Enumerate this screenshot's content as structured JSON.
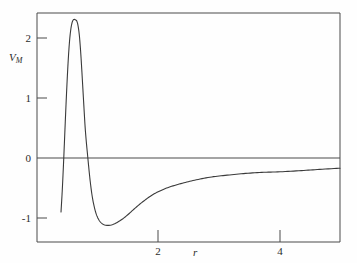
{
  "figure": {
    "background_color": "#fefefe",
    "line_color": "#3a3a3a",
    "axis_color": "#4a4a4a"
  },
  "chart_data": {
    "type": "line",
    "title": "",
    "subtitle": "",
    "xlabel": "r",
    "ylabel": "V_M",
    "ylabel_base": "V",
    "ylabel_sub": "M",
    "grid": false,
    "legend": "none",
    "xlim": [
      0.02,
      4.99
    ],
    "ylim": [
      -1.4,
      2.44
    ],
    "xticks": [
      2,
      4
    ],
    "xtick_labels": [
      "2",
      "4"
    ],
    "yticks": [
      2,
      1,
      0,
      -1
    ],
    "ytick_labels": [
      "2",
      "1",
      "0",
      "-1"
    ],
    "zero_line": 0,
    "annotations": [],
    "series": [
      {
        "name": "V_M",
        "x": [
          0.41,
          0.43,
          0.45,
          0.47,
          0.49,
          0.51,
          0.53,
          0.55,
          0.57,
          0.59,
          0.61,
          0.63,
          0.65,
          0.67,
          0.69,
          0.71,
          0.73,
          0.75,
          0.78,
          0.81,
          0.85,
          0.89,
          0.93,
          0.98,
          1.03,
          1.08,
          1.14,
          1.22,
          1.3,
          1.4,
          1.5,
          1.62,
          1.75,
          1.9,
          2.05,
          2.2,
          2.4,
          2.6,
          2.85,
          3.1,
          3.4,
          3.7,
          4.0,
          4.35,
          4.65,
          4.99
        ],
        "y": [
          -0.9,
          -0.55,
          -0.12,
          0.36,
          0.84,
          1.28,
          1.66,
          1.95,
          2.14,
          2.25,
          2.3,
          2.31,
          2.3,
          2.28,
          2.2,
          2.05,
          1.8,
          1.48,
          0.95,
          0.45,
          0.0,
          -0.4,
          -0.69,
          -0.91,
          -1.03,
          -1.09,
          -1.12,
          -1.12,
          -1.09,
          -1.03,
          -0.95,
          -0.84,
          -0.73,
          -0.62,
          -0.54,
          -0.48,
          -0.42,
          -0.37,
          -0.32,
          -0.29,
          -0.26,
          -0.24,
          -0.23,
          -0.21,
          -0.19,
          -0.17
        ]
      }
    ],
    "key_points": {
      "left_endpoint": {
        "r": 0.41,
        "V": -0.9
      },
      "maximum": {
        "r": 0.63,
        "V": 2.31
      },
      "zero_crossing": {
        "r": 0.85,
        "V": 0.0
      },
      "minimum": {
        "r": 1.19,
        "V": -1.12
      },
      "right_endpoint": {
        "r": 4.99,
        "V": -0.17
      }
    }
  }
}
